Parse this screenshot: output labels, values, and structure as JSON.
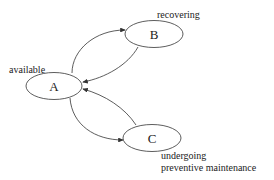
{
  "diagram": {
    "type": "state-transition",
    "nodes": [
      {
        "id": "A",
        "label": "A",
        "state_label": "available"
      },
      {
        "id": "B",
        "label": "B",
        "state_label": "recovering"
      },
      {
        "id": "C",
        "label": "C",
        "state_label_lines": [
          "undergoing",
          "preventive maintenance"
        ]
      }
    ],
    "edges": [
      {
        "from": "A",
        "to": "B"
      },
      {
        "from": "B",
        "to": "A"
      },
      {
        "from": "A",
        "to": "C"
      },
      {
        "from": "C",
        "to": "A"
      }
    ],
    "colors": {
      "stroke": "#333333",
      "background": "#ffffff"
    }
  }
}
